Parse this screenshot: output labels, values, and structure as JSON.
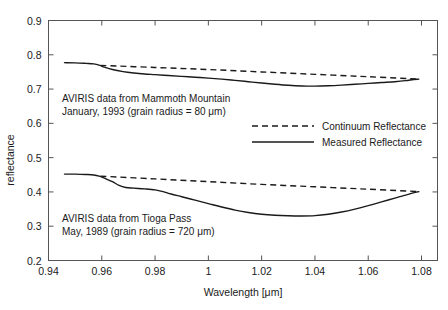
{
  "chart_data": {
    "type": "line",
    "title": "",
    "xlabel": "Wavelength [μm]",
    "ylabel": "reflectance",
    "xlim": [
      0.94,
      1.086
    ],
    "ylim": [
      0.2,
      0.9
    ],
    "grid": false,
    "legend_position": "center-right",
    "x_ticks": [
      "0.94",
      "0.96",
      "0.98",
      "1",
      "1.02",
      "1.04",
      "1.06",
      "1.08"
    ],
    "x_tick_values": [
      0.94,
      0.96,
      0.98,
      1.0,
      1.02,
      1.04,
      1.06,
      1.08
    ],
    "y_ticks": [
      "0.2",
      "0.3",
      "0.4",
      "0.5",
      "0.6",
      "0.7",
      "0.8",
      "0.9"
    ],
    "y_tick_values": [
      0.2,
      0.3,
      0.4,
      0.5,
      0.6,
      0.7,
      0.8,
      0.9
    ],
    "legend": [
      {
        "name": "Continuum Reflectance",
        "style": "dashed"
      },
      {
        "name": "Measured Reflectance",
        "style": "solid"
      }
    ],
    "annotations": [
      {
        "id": "mammoth",
        "line1": "AVIRIS data from Mammoth Mountain",
        "line2": "January, 1993 (grain radius = 80 μm)"
      },
      {
        "id": "tioga",
        "line1": "AVIRIS data from Tioga Pass",
        "line2": "May, 1989 (grain radius = 720 μm)"
      }
    ],
    "series": [
      {
        "name": "Mammoth Mountain Measured Reflectance",
        "dataset": "mammoth",
        "style": "solid",
        "x": [
          0.946,
          0.95,
          0.954,
          0.957,
          0.959,
          0.961,
          0.964,
          0.968,
          0.972,
          0.976,
          0.98,
          0.985,
          0.99,
          0.995,
          1.0,
          1.005,
          1.01,
          1.015,
          1.02,
          1.025,
          1.03,
          1.035,
          1.04,
          1.045,
          1.05,
          1.055,
          1.06,
          1.065,
          1.07,
          1.074,
          1.077,
          1.079
        ],
        "y": [
          0.777,
          0.7765,
          0.775,
          0.7735,
          0.77,
          0.764,
          0.757,
          0.751,
          0.747,
          0.744,
          0.742,
          0.7395,
          0.737,
          0.7345,
          0.732,
          0.729,
          0.7255,
          0.7215,
          0.7175,
          0.714,
          0.711,
          0.709,
          0.7085,
          0.7095,
          0.7115,
          0.714,
          0.7165,
          0.719,
          0.7215,
          0.7245,
          0.728,
          0.729
        ]
      },
      {
        "name": "Mammoth Mountain Continuum Reflectance",
        "dataset": "mammoth",
        "style": "dashed",
        "x": [
          0.9595,
          0.98,
          1.0,
          1.02,
          1.04,
          1.06,
          1.079
        ],
        "y": [
          0.769,
          0.763,
          0.757,
          0.75,
          0.743,
          0.736,
          0.729
        ]
      },
      {
        "name": "Tioga Pass Measured Reflectance",
        "dataset": "tioga",
        "style": "solid",
        "x": [
          0.946,
          0.95,
          0.954,
          0.957,
          0.959,
          0.961,
          0.964,
          0.9665,
          0.969,
          0.972,
          0.976,
          0.98,
          0.983,
          0.986,
          0.99,
          0.995,
          1.0,
          1.005,
          1.01,
          1.015,
          1.02,
          1.025,
          1.03,
          1.035,
          1.04,
          1.045,
          1.05,
          1.055,
          1.06,
          1.065,
          1.07,
          1.075,
          1.079
        ],
        "y": [
          0.452,
          0.452,
          0.451,
          0.4495,
          0.446,
          0.44,
          0.43,
          0.419,
          0.413,
          0.411,
          0.409,
          0.406,
          0.401,
          0.394,
          0.386,
          0.376,
          0.366,
          0.356,
          0.347,
          0.34,
          0.335,
          0.332,
          0.3305,
          0.33,
          0.331,
          0.335,
          0.3415,
          0.35,
          0.36,
          0.371,
          0.382,
          0.393,
          0.401
        ]
      },
      {
        "name": "Tioga Pass Continuum Reflectance",
        "dataset": "tioga",
        "style": "dashed",
        "x": [
          0.9595,
          0.98,
          1.0,
          1.02,
          1.04,
          1.06,
          1.079
        ],
        "y": [
          0.446,
          0.438,
          0.43,
          0.422,
          0.415,
          0.408,
          0.401
        ]
      }
    ]
  },
  "colors": {
    "ink": "#1a1a1a",
    "frame": "#555555",
    "background": "#ffffff"
  }
}
